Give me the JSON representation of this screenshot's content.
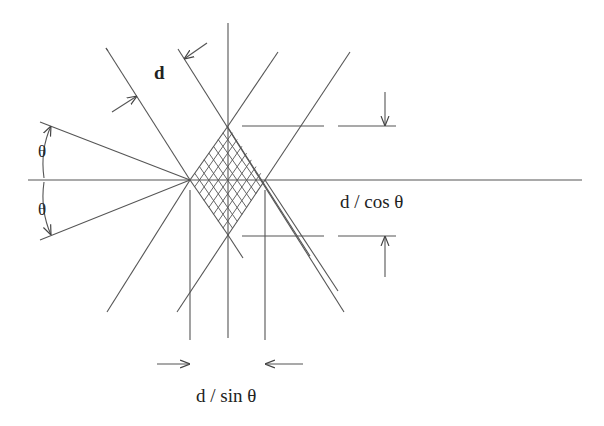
{
  "diagram": {
    "labels": {
      "spacing": "d",
      "angle_upper": "θ",
      "angle_lower": "θ",
      "vertical_dimension": "d / cos θ",
      "horizontal_dimension": "d / sin θ"
    },
    "colors": {
      "line": "#555555",
      "text": "#222222",
      "background": "#ffffff"
    }
  }
}
